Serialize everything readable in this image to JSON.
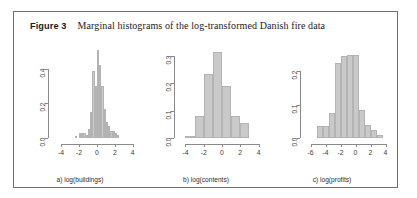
{
  "figure": {
    "label": "Figure 3",
    "title": "Marginal histograms of the log-transformed Danish fire data",
    "border_color": "#6e6e6e",
    "background": "#ffffff",
    "bar_fill": "#c9c9c9",
    "axis_color": "#8a8a8a"
  },
  "chart_data": [
    {
      "type": "bar",
      "panel": "a",
      "title": "a) log(buildings)",
      "xlabel": "a) log(buildings)",
      "ylabel": "",
      "xlim": [
        -4.8,
        4.6
      ],
      "ylim": [
        0.0,
        0.52
      ],
      "xticks": [
        -4,
        -2,
        0,
        2,
        4
      ],
      "xtick_labels": [
        "-4",
        "-2",
        "0",
        "2",
        "4"
      ],
      "yticks": [
        0.0,
        0.2,
        0.4
      ],
      "ytick_labels": [
        "0.0",
        "0.2",
        "0.4"
      ],
      "grid": false,
      "bin_width": 0.25,
      "bin_starts": [
        -2.5,
        -2.25,
        -2.0,
        -1.75,
        -1.5,
        -1.25,
        -1.0,
        -0.75,
        -0.5,
        -0.25,
        0.0,
        0.25,
        0.5,
        0.75,
        1.0,
        1.25,
        1.5,
        1.75,
        2.0,
        2.25
      ],
      "values": [
        0.01,
        0.0,
        0.03,
        0.03,
        0.03,
        0.02,
        0.05,
        0.15,
        0.39,
        0.3,
        0.51,
        0.42,
        0.3,
        0.17,
        0.09,
        0.07,
        0.04,
        0.04,
        0.03,
        0.02
      ]
    },
    {
      "type": "bar",
      "panel": "b",
      "title": "b) log(contents)",
      "xlabel": "b) log(contents)",
      "ylabel": "",
      "xlim": [
        -4.6,
        4.6
      ],
      "ylim": [
        0.0,
        0.33
      ],
      "xticks": [
        -4,
        -2,
        0,
        2,
        4
      ],
      "xtick_labels": [
        "-4",
        "-2",
        "0",
        "2",
        "4"
      ],
      "yticks": [
        0.0,
        0.1,
        0.2,
        0.3
      ],
      "ytick_labels": [
        "0.0",
        "0.1",
        "0.2",
        "0.3"
      ],
      "grid": false,
      "bin_width": 1.0,
      "bin_starts": [
        -4.0,
        -3.0,
        -2.0,
        -1.0,
        0.0,
        1.0,
        2.0
      ],
      "values": [
        0.008,
        0.08,
        0.235,
        0.315,
        0.19,
        0.08,
        0.055
      ]
    },
    {
      "type": "bar",
      "panel": "c",
      "title": "c) log(profits)",
      "xlabel": "c) log(profits)",
      "ylabel": "",
      "xlim": [
        -6.6,
        4.6
      ],
      "ylim": [
        0.0,
        0.27
      ],
      "xticks": [
        -6,
        -4,
        -2,
        0,
        2,
        4
      ],
      "xtick_labels": [
        "-6",
        "-4",
        "-2",
        "0",
        "2",
        "4"
      ],
      "yticks": [
        0.0,
        0.1,
        0.2
      ],
      "ytick_labels": [
        "0.0",
        "0.1",
        "0.2"
      ],
      "grid": false,
      "bin_width": 0.8,
      "bin_starts": [
        -5.2,
        -4.4,
        -3.6,
        -2.8,
        -2.0,
        -1.2,
        -0.4,
        0.4,
        1.2,
        2.0,
        2.8
      ],
      "values": [
        0.035,
        0.035,
        0.075,
        0.225,
        0.245,
        0.25,
        0.25,
        0.085,
        0.04,
        0.025,
        0.008
      ]
    }
  ]
}
